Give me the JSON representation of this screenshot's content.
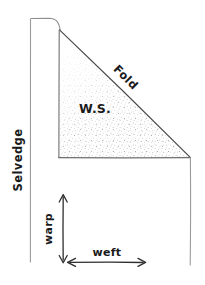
{
  "figure": {
    "style": "hand-drawn pencil sketch",
    "background_color": "#ffffff",
    "ink_color": "#3a3a3a",
    "label_color": "#1a1a1a",
    "stipple_color": "#8c8c8c"
  },
  "labels": {
    "selvedge": "Selvedge",
    "fold": "Fold",
    "wrong_side": "W.S.",
    "warp": "warp",
    "weft": "weft"
  },
  "measure_arrows": [
    {
      "name": "warp",
      "label": "warp",
      "orientation": "vertical",
      "double_headed": true
    },
    {
      "name": "weft",
      "label": "weft",
      "orientation": "horizontal",
      "double_headed": true
    }
  ],
  "regions": [
    {
      "name": "folded-triangle",
      "label": "W.S.",
      "shading": "stipple"
    }
  ],
  "edges": [
    {
      "name": "selvedge-edge",
      "label": "Selvedge",
      "orientation": "vertical-left"
    },
    {
      "name": "fold-edge",
      "label": "Fold",
      "orientation": "diagonal"
    }
  ]
}
